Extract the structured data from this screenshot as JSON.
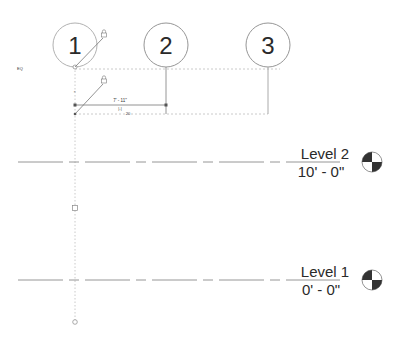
{
  "view": {
    "type": "Revit elevation view",
    "background": "#ffffff",
    "line_color": "#8c8c8c",
    "dark_color": "#2a2a2a"
  },
  "grids": [
    {
      "label": "1",
      "cx": 75,
      "cy": 45,
      "r": 22,
      "line_x": 75,
      "selected": true
    },
    {
      "label": "2",
      "cx": 166,
      "cy": 45,
      "r": 22,
      "line_x": 166,
      "selected": false
    },
    {
      "label": "3",
      "cx": 268,
      "cy": 45,
      "r": 22,
      "line_x": 268,
      "selected": false
    }
  ],
  "levels": [
    {
      "name": "Level 2",
      "elevation": "10' - 0\"",
      "y": 162
    },
    {
      "name": "Level 1",
      "elevation": "0' - 0\"",
      "y": 280
    }
  ],
  "dimension": {
    "value": "7' - 11\"",
    "eq_symbol": "|-|",
    "secondary": "20"
  },
  "annotations": {
    "eq_toggle": "EQ"
  }
}
